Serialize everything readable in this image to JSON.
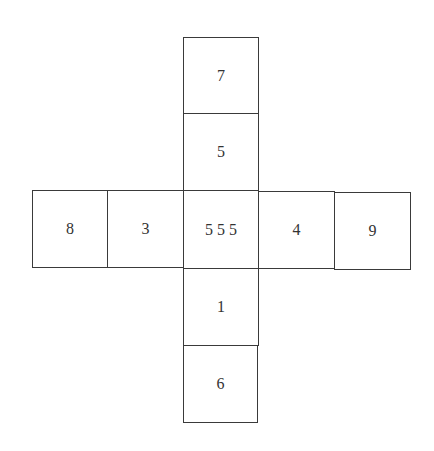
{
  "diagram": {
    "type": "cube-net",
    "column": [
      {
        "label": "7",
        "x": 183,
        "y": 37,
        "w": 76,
        "h": 77
      },
      {
        "label": "5",
        "x": 183,
        "y": 113,
        "w": 76,
        "h": 78
      },
      {
        "label": "1",
        "x": 183,
        "y": 268,
        "w": 76,
        "h": 78
      },
      {
        "label": "6",
        "x": 183,
        "y": 345,
        "w": 75,
        "h": 78
      }
    ],
    "row": [
      {
        "label": "8",
        "x": 32,
        "y": 190,
        "w": 76,
        "h": 78
      },
      {
        "label": "3",
        "x": 107,
        "y": 190,
        "w": 77,
        "h": 78
      },
      {
        "label": "5 5 5",
        "x": 183,
        "y": 190,
        "w": 76,
        "h": 79
      },
      {
        "label": "4",
        "x": 258,
        "y": 191,
        "w": 77,
        "h": 78
      },
      {
        "label": "9",
        "x": 334,
        "y": 192,
        "w": 77,
        "h": 78
      }
    ]
  }
}
